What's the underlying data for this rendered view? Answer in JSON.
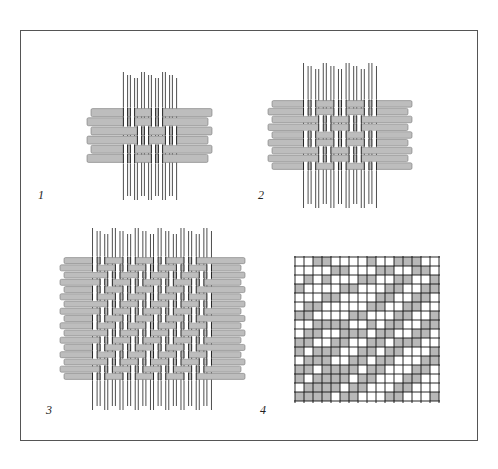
{
  "figure": {
    "panels": [
      {
        "id": 1,
        "label": "1",
        "description": "Basket weave sample (small)",
        "warps": 8,
        "wefts": 6
      },
      {
        "id": 2,
        "label": "2",
        "description": "Basket weave variation (medium)",
        "warps": 10,
        "wefts": 9
      },
      {
        "id": 3,
        "label": "3",
        "description": "Twill weave sample (large)",
        "warps": 16,
        "wefts": 16
      },
      {
        "id": 4,
        "label": "4",
        "description": "Weave draft on grid",
        "columns": 16,
        "rows": 16
      }
    ]
  },
  "colors": {
    "weft": "#bdbdbd",
    "weft_edge": "#7a7a7a",
    "warp": "#ffffff",
    "warp_edge": "#222222",
    "grid_line": "#111111",
    "grid_fill": "#b8b8b8",
    "frame": "#555555"
  },
  "grid_pattern": [
    "0011000010011100",
    "0000110001100110",
    "0101000110011001",
    "1000011000110011",
    "0001100001100110",
    "0110000011001100",
    "1100001100011001",
    "0011110010110011",
    "0110011101100110",
    "1100110011011100",
    "1011100110110001",
    "0111001101100011",
    "1101111011000110",
    "1011110110001100",
    "0111101100011000",
    "1111011000110001"
  ]
}
